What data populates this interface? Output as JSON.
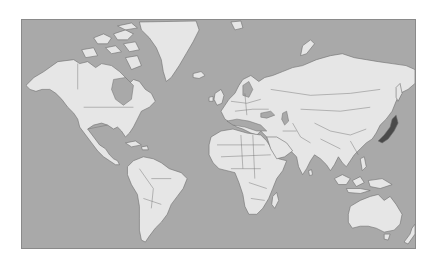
{
  "map": {
    "projection": "mercator",
    "colors": {
      "ocean": "#a9a9a9",
      "land": "#e6e6e6",
      "outline": "#6e6e6e",
      "highlight": "#4a4a4a",
      "frame": "#8a8a8a",
      "background": "#ffffff"
    },
    "highlighted_regions": [
      "Japan"
    ],
    "labels": []
  }
}
